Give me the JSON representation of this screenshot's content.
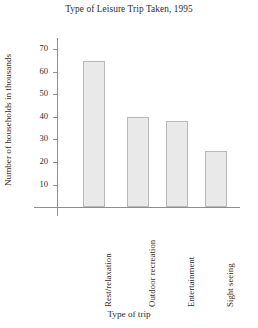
{
  "chart_data": {
    "type": "bar",
    "title": "Type of Leisure Trip Taken, 1995",
    "xlabel": "Type of  trip",
    "ylabel": "Number of households in thousands",
    "categories": [
      "Rest/relaxation",
      "Outdoor recreation",
      "Entertainment",
      "Sight seeing"
    ],
    "values": [
      65,
      40,
      38,
      25
    ],
    "ylim": [
      0,
      75
    ],
    "yticks": [
      10,
      20,
      30,
      40,
      50,
      60,
      70
    ],
    "ytick_labels": [
      "10",
      "20",
      "30",
      "40",
      "50",
      "60",
      "70"
    ],
    "grid": false,
    "legend": false,
    "bar_fill": "#e9e9e9",
    "bar_border": "#b9b9b9",
    "axis_color": "#8e8e8e",
    "text_color": "#2e2e2e"
  }
}
